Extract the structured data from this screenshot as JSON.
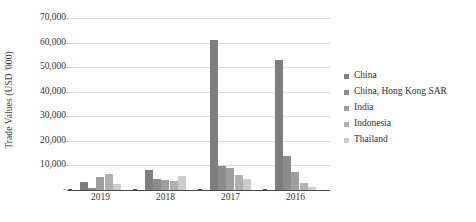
{
  "chart_data": {
    "type": "bar",
    "title": "",
    "xlabel": "",
    "ylabel": "Trade Values (USD '000)",
    "categories": [
      "2019",
      "2018",
      "2017",
      "2016"
    ],
    "ylim": [
      0,
      70000
    ],
    "ytick_values": [
      0,
      10000,
      20000,
      30000,
      40000,
      50000,
      60000,
      70000
    ],
    "ytick_labels": [
      "-",
      "10,000",
      "20,000",
      "30,000",
      "40,000",
      "50,000",
      "60,000",
      "70,000"
    ],
    "grid": true,
    "legend_position": "right",
    "series": [
      {
        "name": "China",
        "color": "#7d7d7d",
        "values": [
          3200,
          8100,
          61200,
          53000
        ]
      },
      {
        "name": "China, Hong Kong SAR",
        "color": "#8c8c8c",
        "values": [
          900,
          4300,
          9700,
          13900
        ]
      },
      {
        "name": "India",
        "color": "#9e9e9e",
        "values": [
          5100,
          4100,
          9100,
          7200
        ]
      },
      {
        "name": "Indonesia",
        "color": "#b0b0b0",
        "values": [
          6400,
          3500,
          6300,
          3000
        ]
      },
      {
        "name": "Thailand",
        "color": "#cccccc",
        "values": [
          2400,
          5600,
          4600,
          1300
        ]
      }
    ]
  },
  "axis": {
    "y_title": "Trade Values (USD '000)"
  },
  "colors": {
    "gridline": "#d9d9d9",
    "baseline": "#4a4a4a",
    "text": "#333333",
    "background": "#ffffff"
  }
}
